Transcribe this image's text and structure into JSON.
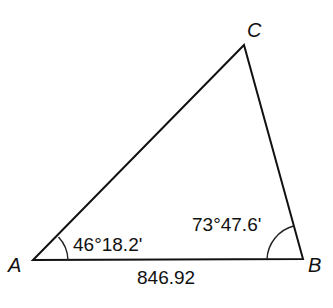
{
  "diagram": {
    "type": "triangle",
    "vertices": {
      "A": {
        "label": "A"
      },
      "B": {
        "label": "B"
      },
      "C": {
        "label": "C"
      }
    },
    "angles": {
      "A": "46°18.2'",
      "B": "73°47.6'"
    },
    "sides": {
      "AB": "846.92"
    },
    "colors": {
      "stroke": "#111111",
      "background": "#ffffff"
    }
  }
}
